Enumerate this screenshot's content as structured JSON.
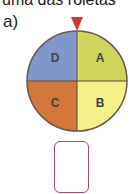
{
  "header": {
    "text": "uma das roletas"
  },
  "item_label": "a)",
  "wheel": {
    "sectors": [
      {
        "label": "A",
        "color": "#cfd45a"
      },
      {
        "label": "B",
        "color": "#f5f28a"
      },
      {
        "label": "C",
        "color": "#d3763a"
      },
      {
        "label": "D",
        "color": "#7f98c9"
      }
    ],
    "pointer_color": "#d8362b",
    "border_color": "#6b5a4a"
  },
  "answer_box": {
    "value": ""
  }
}
